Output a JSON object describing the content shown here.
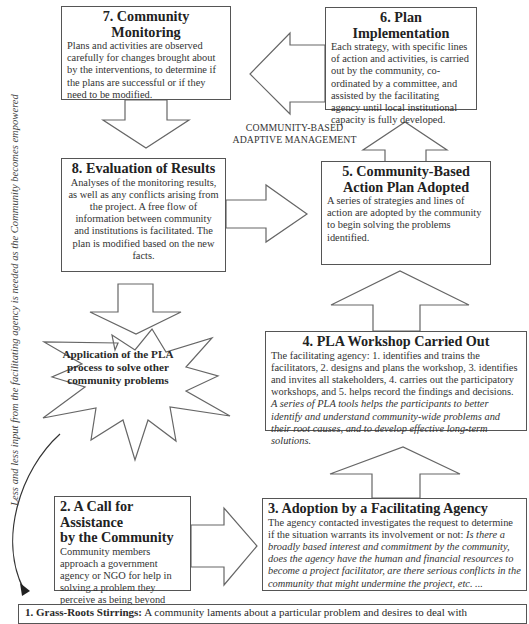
{
  "diagram": {
    "side_label": "Less and less input from the facilitating agency is needed as the Community becomes empowered",
    "center_label": {
      "line1": "COMMUNITY-BASED",
      "line2": "ADAPTIVE MANAGEMENT"
    },
    "burst": {
      "text": "Application of the PLA process to solve other community problems"
    },
    "steps": [
      {
        "number": 1,
        "title": "1.  Grass-Roots Stirrings:",
        "body": " A community laments about a particular problem and desires to deal with"
      },
      {
        "number": 2,
        "title_line1": "2. A Call for Assistance",
        "title_line2": "by the Community",
        "body": "Community members approach a government agency or NGO for help in solving a problem they perceive as being beyond their capacity."
      },
      {
        "number": 3,
        "title": "3. Adoption by a Facilitating Agency",
        "body": "The agency contacted investigates the request to determine if the situation warrants its involvement or not: ",
        "body_italic": "Is there a broadly based interest and commitment by the community, does the agency have the human and financial resources to become a project facilitator, are there serious conflicts in the community that might undermine the project, etc. ..."
      },
      {
        "number": 4,
        "title": "4. PLA Workshop Carried Out",
        "body": "The facilitating agency:  1. identifies and trains the facilitators, 2. designs and plans the workshop,  3. identifies and invites all stakeholders, 4. carries out the participatory workshops, and 5. helps record the findings and decisions.",
        "body_italic": "A series of PLA tools helps the participants to better identify and understand community-wide problems and their root causes, and to develop effective long-term solutions."
      },
      {
        "number": 5,
        "title_line1": "5. Community-Based",
        "title_line2": "Action Plan Adopted",
        "body": "A series of strategies and lines of action are adopted by the community to begin solving the problems identified."
      },
      {
        "number": 6,
        "title": "6. Plan Implementation",
        "body": "Each strategy, with specific lines of action and activities, is carried out by the community, co-ordinated by a committee, and assisted by the facilitating agency until local institutional capacity is fully developed."
      },
      {
        "number": 7,
        "title": "7. Community Monitoring",
        "body": "Plans and activities are observed carefully for changes brought about by the interventions, to determine if the plans are successful or if they need to be modified."
      },
      {
        "number": 8,
        "title": "8. Evaluation of Results",
        "body": "Analyses of the monitoring results, as well as any conflicts arising from the project.  A free flow of information between community and institutions is facilitated. The plan is modified based on the new facts."
      }
    ],
    "colors": {
      "stroke": "#555555",
      "text": "#2a2a2a",
      "background": "#ffffff"
    }
  }
}
